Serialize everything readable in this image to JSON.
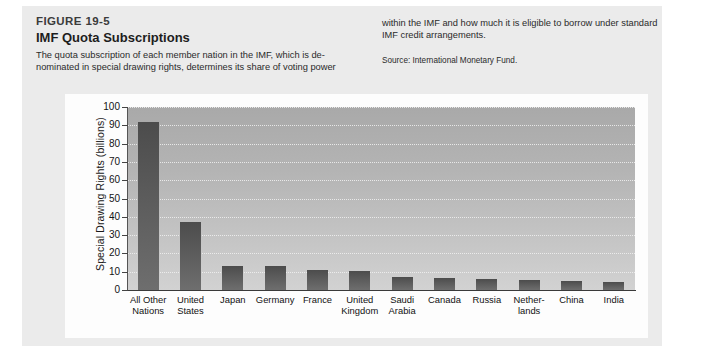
{
  "figure": {
    "number": "FIGURE 19-5",
    "title": "IMF Quota Subscriptions",
    "caption_left": "The quota subscription of each member nation in the IMF, which is de-nominated in special drawing rights, determines its share of voting power",
    "caption_right": "within the IMF and how much it is eligible to borrow under standard IMF credit arrangements.",
    "source": "Source: International Monetary Fund."
  },
  "colors": {
    "plate": "#ebebeb",
    "card": "#fdfdfd",
    "plot_top": "#a9a9a9",
    "plot_bottom": "#d2d2d2",
    "bar_top": "#4c4c4c",
    "bar_bottom": "#6e6e6e",
    "gridline": "#f2f2f2",
    "axis": "#3a3a3a"
  },
  "chart_data": {
    "type": "bar",
    "title": "IMF Quota Subscriptions",
    "xlabel": "",
    "ylabel": "Special Drawing Rights (billions)",
    "ylim": [
      0,
      100
    ],
    "ytick_step": 10,
    "yticks": [
      100,
      90,
      80,
      70,
      60,
      50,
      40,
      30,
      20,
      10,
      0
    ],
    "grid": true,
    "legend": false,
    "categories": [
      "All Other Nations",
      "United States",
      "Japan",
      "Germany",
      "France",
      "United Kingdom",
      "Saudi Arabia",
      "Canada",
      "Russia",
      "Netherlands",
      "China",
      "India"
    ],
    "category_lines": [
      [
        "All Other",
        "Nations"
      ],
      [
        "United",
        "States"
      ],
      [
        "Japan"
      ],
      [
        "Germany"
      ],
      [
        "France"
      ],
      [
        "United",
        "Kingdom"
      ],
      [
        "Saudi",
        "Arabia"
      ],
      [
        "Canada"
      ],
      [
        "Russia"
      ],
      [
        "Nether-",
        "lands"
      ],
      [
        "China"
      ],
      [
        "India"
      ]
    ],
    "values": [
      92,
      37,
      13.3,
      13,
      10.7,
      10.5,
      7,
      6.4,
      5.9,
      5.2,
      4.7,
      4.2
    ]
  }
}
